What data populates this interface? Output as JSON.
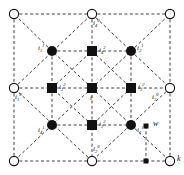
{
  "figure": {
    "title": "",
    "width": 184,
    "height": 175,
    "background": "#ffffff",
    "line_color": "#2b2b2b",
    "node_fill_dark": "#111111",
    "node_fill_light": "#ffffff",
    "line_style": "dashed"
  },
  "nodes": {
    "corners": [
      {
        "id": "corner-top-left",
        "shape": "open-circle",
        "x": 14,
        "y": 14,
        "label": ""
      },
      {
        "id": "corner-top-right",
        "shape": "open-circle",
        "x": 170,
        "y": 14,
        "label": ""
      },
      {
        "id": "corner-bottom-left",
        "shape": "open-circle",
        "x": 14,
        "y": 161,
        "label": ""
      },
      {
        "id": "corner-bottom-right",
        "shape": "open-circle",
        "x": 170,
        "y": 161,
        "label": ""
      }
    ],
    "order0": [
      {
        "id": "node-i1-0",
        "shape": "open-circle",
        "x": 14,
        "y": 88,
        "label": "i",
        "sub": "1",
        "sup": "0"
      },
      {
        "id": "node-i2-0",
        "shape": "open-circle",
        "x": 92,
        "y": 161,
        "label": "i",
        "sub": "2",
        "sup": "0"
      },
      {
        "id": "node-i3-0",
        "shape": "open-circle",
        "x": 170,
        "y": 88,
        "label": "i",
        "sub": "3",
        "sup": "0"
      },
      {
        "id": "node-i4-0",
        "shape": "open-circle",
        "x": 92,
        "y": 14,
        "label": "i",
        "sub": "4",
        "sup": "0"
      }
    ],
    "order1": [
      {
        "id": "node-i1-1",
        "shape": "filled-circle",
        "x": 52,
        "y": 51,
        "label": "i",
        "sub": "1",
        "sup": "1"
      },
      {
        "id": "node-i2-1",
        "shape": "filled-circle",
        "x": 131,
        "y": 51,
        "label": "i",
        "sub": "2",
        "sup": "1"
      },
      {
        "id": "node-i3-1",
        "shape": "filled-circle",
        "x": 131,
        "y": 125,
        "label": "i",
        "sub": "3",
        "sup": "1"
      },
      {
        "id": "node-i4-1",
        "shape": "filled-circle",
        "x": 52,
        "y": 125,
        "label": "i",
        "sub": "4",
        "sup": "1"
      }
    ],
    "order2": [
      {
        "id": "node-i1-2",
        "shape": "filled-square",
        "x": 52,
        "y": 88,
        "label": "i",
        "sub": "1",
        "sup": "2"
      },
      {
        "id": "node-i2-2",
        "shape": "filled-square",
        "x": 92,
        "y": 125,
        "label": "i",
        "sub": "2",
        "sup": "2"
      },
      {
        "id": "node-i3-2",
        "shape": "filled-square",
        "x": 131,
        "y": 88,
        "label": "i",
        "sub": "3",
        "sup": "2"
      },
      {
        "id": "node-i4-2",
        "shape": "filled-square",
        "x": 92,
        "y": 51,
        "label": "i",
        "sub": "4",
        "sup": "2"
      }
    ],
    "center": {
      "id": "node-i-center",
      "shape": "filled-square",
      "x": 92,
      "y": 88,
      "label": "i",
      "sub": "",
      "sup": ""
    }
  },
  "legend": [
    {
      "id": "legend-w",
      "shape": "filled-square",
      "x": 146,
      "y": 126,
      "label": "w"
    },
    {
      "id": "legend-k",
      "shape": "open-circle",
      "x": 170,
      "y": 161,
      "label": "k"
    }
  ],
  "legend_marks": [
    {
      "id": "legend-tick-bottom",
      "shape": "filled-square",
      "x": 146,
      "y": 161
    }
  ],
  "labels": {
    "center": "i",
    "w": "w",
    "k": "k"
  }
}
